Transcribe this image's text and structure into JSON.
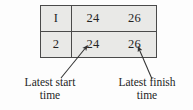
{
  "figure": {
    "type": "annotated-table",
    "background_color": "#fdfdfd",
    "table": {
      "fill_color": "#e9e9e7",
      "border_color": "#4a4a4a",
      "columns": [
        "activity",
        "latest_start_time",
        "latest_finish_time"
      ],
      "rows": [
        {
          "id": "I",
          "latest_start": "24",
          "latest_finish": "26"
        },
        {
          "id": "2",
          "latest_start": "24",
          "latest_finish": "26"
        }
      ]
    },
    "annotations": [
      {
        "name": "latest-start-annotation",
        "line1": "Latest start",
        "line2": "time",
        "points_to": "row-2 latest start value 24"
      },
      {
        "name": "latest-finish-annotation",
        "line1": "Latest finish",
        "line2": "time",
        "points_to": "row-2 latest finish value 26"
      }
    ]
  }
}
